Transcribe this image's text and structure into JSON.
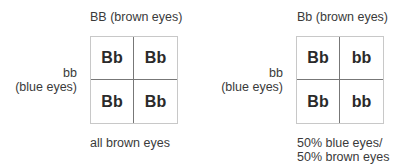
{
  "crosses": [
    {
      "top_parent": "BB (brown eyes)",
      "side_parent_line1": "bb",
      "side_parent_line2": "(blue eyes)",
      "cells": [
        "Bb",
        "Bb",
        "Bb",
        "Bb"
      ],
      "result_line1": "all brown eyes",
      "result_line2": ""
    },
    {
      "top_parent": "Bb (brown eyes)",
      "side_parent_line1": "bb",
      "side_parent_line2": "(blue eyes)",
      "cells": [
        "Bb",
        "bb",
        "Bb",
        "bb"
      ],
      "result_line1": "50% blue eyes/",
      "result_line2": "50% brown eyes"
    }
  ]
}
